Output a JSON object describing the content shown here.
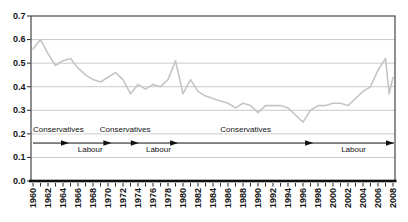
{
  "figure": {
    "width": 408,
    "height": 222,
    "colors": {
      "background": "#ffffff",
      "plot_border": "#454545",
      "axis": "#0f0f0f",
      "gridline": "#c9c9c9",
      "series_line": "#c5c5c5",
      "tick_text": "#141414",
      "annotation": "#111111",
      "label_halo": "#ffffff"
    }
  },
  "chart_data": {
    "type": "line",
    "title": "",
    "xlabel": "",
    "ylabel": "",
    "xlim": [
      1959.73,
      2008.27
    ],
    "ylim": [
      0.0,
      0.7
    ],
    "grid": true,
    "legend": false,
    "ytick_values": [
      0.0,
      0.1,
      0.2,
      0.3,
      0.4,
      0.5,
      0.6,
      0.7
    ],
    "ytick_labels": [
      "0.0",
      "0.1",
      "0.2",
      "0.3",
      "0.4",
      "0.5",
      "0.6",
      "0.7"
    ],
    "xtick_label_values": [
      1960,
      1962,
      1964,
      1966,
      1968,
      1970,
      1972,
      1974,
      1976,
      1978,
      1980,
      1982,
      1984,
      1986,
      1988,
      1990,
      1992,
      1994,
      1996,
      1998,
      2000,
      2002,
      2004,
      2006,
      2008
    ],
    "xtick_minor_step": 1,
    "series": [
      {
        "name": "series",
        "x": [
          1960,
          1961,
          1962,
          1963,
          1964,
          1965,
          1966,
          1967,
          1968,
          1969,
          1970,
          1971,
          1972,
          1973,
          1974,
          1975,
          1976,
          1977,
          1978,
          1979,
          1980,
          1981,
          1982,
          1983,
          1984,
          1985,
          1986,
          1987,
          1988,
          1989,
          1990,
          1991,
          1992,
          1993,
          1994,
          1995,
          1996,
          1997,
          1998,
          1999,
          2000,
          2001,
          2002,
          2003,
          2004,
          2005,
          2006,
          2007,
          2007.5,
          2008
        ],
        "y": [
          0.56,
          0.6,
          0.54,
          0.49,
          0.51,
          0.52,
          0.48,
          0.45,
          0.43,
          0.42,
          0.44,
          0.46,
          0.43,
          0.37,
          0.41,
          0.39,
          0.41,
          0.4,
          0.43,
          0.51,
          0.37,
          0.43,
          0.38,
          0.36,
          0.35,
          0.34,
          0.33,
          0.31,
          0.33,
          0.32,
          0.29,
          0.32,
          0.32,
          0.32,
          0.31,
          0.28,
          0.25,
          0.3,
          0.32,
          0.32,
          0.33,
          0.33,
          0.32,
          0.35,
          0.38,
          0.4,
          0.47,
          0.52,
          0.37,
          0.44
        ]
      }
    ],
    "annotations": {
      "arrow_line_value": 0.161,
      "label_above_value": 0.208,
      "label_below_value": 0.123,
      "government_periods": [
        {
          "label": "Conservatives",
          "start": 1959.73,
          "end": 1964.8,
          "label_side": "above"
        },
        {
          "label": "Labour",
          "start": 1964.8,
          "end": 1970.45,
          "label_side": "below"
        },
        {
          "label": "Conservatives",
          "start": 1970.45,
          "end": 1974.1,
          "label_side": "above"
        },
        {
          "label": "Labour",
          "start": 1974.1,
          "end": 1979.35,
          "label_side": "below"
        },
        {
          "label": "Conservatives",
          "start": 1979.35,
          "end": 1997.35,
          "label_side": "above"
        },
        {
          "label": "Labour",
          "start": 1997.35,
          "end": 2008.27,
          "label_side": "below"
        }
      ]
    }
  }
}
